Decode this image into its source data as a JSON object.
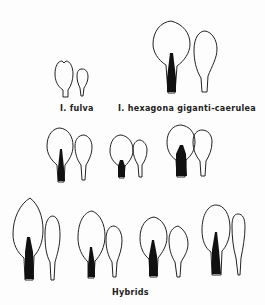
{
  "figure": {
    "labels": {
      "fulva": "I. fulva",
      "hexagona": "I. hexagona giganti-caerulea",
      "hybrids": "Hybrids"
    },
    "groups": [
      {
        "name": "I. fulva",
        "row": 1,
        "signal": "none"
      },
      {
        "name": "I. hexagona giganti-caerulea",
        "row": 1,
        "signal": "large"
      },
      {
        "name": "Hybrid 1",
        "row": 2,
        "signal": "medium"
      },
      {
        "name": "Hybrid 2",
        "row": 2,
        "signal": "small"
      },
      {
        "name": "Hybrid 3",
        "row": 2,
        "signal": "large"
      },
      {
        "name": "Hybrid 4",
        "row": 3,
        "signal": "large"
      },
      {
        "name": "Hybrid 5",
        "row": 3,
        "signal": "small"
      },
      {
        "name": "Hybrid 6",
        "row": 3,
        "signal": "medium"
      },
      {
        "name": "Hybrid 7",
        "row": 3,
        "signal": "medium"
      }
    ],
    "colors": {
      "ink": "#222222",
      "signal": "#111111",
      "background": "#fdfdfd"
    }
  }
}
